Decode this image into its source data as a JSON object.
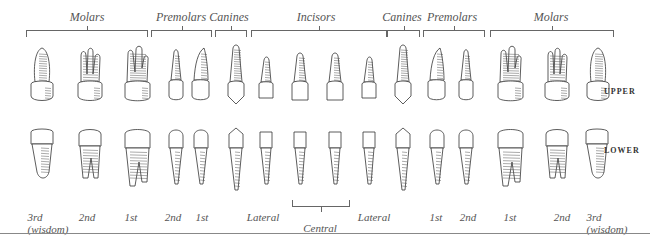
{
  "groups_top": [
    {
      "label": "Molars",
      "center": 87,
      "left": 26,
      "width": 120
    },
    {
      "label": "Premolars",
      "center": 181,
      "left": 151,
      "width": 59
    },
    {
      "label": "Canines",
      "center": 229,
      "left": 215,
      "width": 30
    },
    {
      "label": "Incisors",
      "center": 316,
      "left": 251,
      "width": 134
    },
    {
      "label": "Canines",
      "center": 402,
      "left": 387,
      "width": 31
    },
    {
      "label": "Premolars",
      "center": 452,
      "left": 423,
      "width": 60
    },
    {
      "label": "Molars",
      "center": 551,
      "left": 490,
      "width": 122
    }
  ],
  "row_labels": {
    "upper": "UPPER",
    "lower": "LOWER"
  },
  "upper_teeth": [
    {
      "type": "molar3",
      "x": 42
    },
    {
      "type": "molar2",
      "x": 90
    },
    {
      "type": "molar1",
      "x": 137
    },
    {
      "type": "premolar",
      "x": 176
    },
    {
      "type": "premolar-curved",
      "x": 201
    },
    {
      "type": "canine",
      "x": 236
    },
    {
      "type": "incisor-lat",
      "x": 266
    },
    {
      "type": "incisor",
      "x": 300
    },
    {
      "type": "incisor",
      "x": 335
    },
    {
      "type": "incisor-lat",
      "x": 369
    },
    {
      "type": "canine",
      "x": 403
    },
    {
      "type": "premolar-curved",
      "x": 437
    },
    {
      "type": "premolar",
      "x": 466
    },
    {
      "type": "molar1",
      "x": 510
    },
    {
      "type": "molar2",
      "x": 557
    },
    {
      "type": "molar3",
      "x": 598
    }
  ],
  "lower_teeth": [
    {
      "type": "lmolar3",
      "x": 42
    },
    {
      "type": "lmolar2",
      "x": 90
    },
    {
      "type": "lmolar1",
      "x": 137
    },
    {
      "type": "lpremolar",
      "x": 176
    },
    {
      "type": "lpremolar",
      "x": 201
    },
    {
      "type": "lcanine",
      "x": 236
    },
    {
      "type": "lincisor",
      "x": 266
    },
    {
      "type": "lincisor",
      "x": 300
    },
    {
      "type": "lincisor",
      "x": 335
    },
    {
      "type": "lincisor",
      "x": 369
    },
    {
      "type": "lcanine",
      "x": 403
    },
    {
      "type": "lpremolar",
      "x": 437
    },
    {
      "type": "lpremolar",
      "x": 466
    },
    {
      "type": "lmolar1",
      "x": 510
    },
    {
      "type": "lmolar2",
      "x": 557
    },
    {
      "type": "lmolar3",
      "x": 597
    }
  ],
  "position_labels": [
    {
      "text": "3rd",
      "sub": "(wisdom)",
      "x": 48
    },
    {
      "text": "2nd",
      "x": 87
    },
    {
      "text": "1st",
      "x": 131
    },
    {
      "text": "2nd",
      "x": 173
    },
    {
      "text": "1st",
      "x": 202
    },
    {
      "text": "Lateral",
      "x": 263
    },
    {
      "text": "Central",
      "x": 320,
      "y": 222
    },
    {
      "text": "Lateral",
      "x": 374
    },
    {
      "text": "1st",
      "x": 436
    },
    {
      "text": "2nd",
      "x": 468
    },
    {
      "text": "1st",
      "x": 510
    },
    {
      "text": "2nd",
      "x": 562
    },
    {
      "text": "3rd",
      "sub": "(wisdom)",
      "x": 607
    }
  ]
}
